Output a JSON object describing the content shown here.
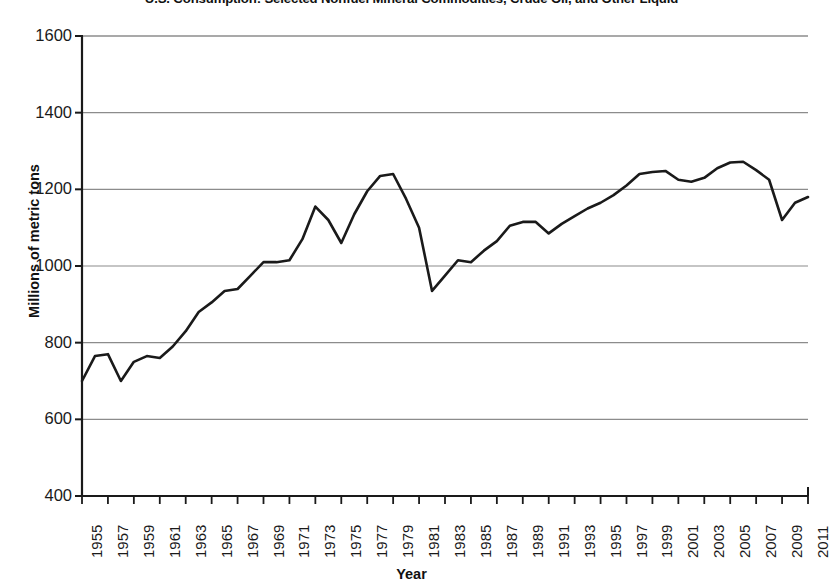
{
  "chart_data": {
    "type": "line",
    "title": "U.S. Consumption: Selected Nonfuel Mineral Commodities,  Crude Oil, and Other Liquid",
    "xlabel": "Year",
    "ylabel": "Millions of metric tons",
    "xlim": [
      1955,
      2011
    ],
    "ylim": [
      400,
      1600
    ],
    "yticks": [
      400,
      600,
      800,
      1000,
      1200,
      1400,
      1600
    ],
    "ytick_labels": [
      "400",
      "600",
      "800",
      "1000",
      "1200",
      "1400",
      "1600"
    ],
    "xticks": [
      1955,
      1957,
      1959,
      1961,
      1963,
      1965,
      1967,
      1969,
      1971,
      1973,
      1975,
      1977,
      1979,
      1981,
      1983,
      1985,
      1987,
      1989,
      1991,
      1993,
      1995,
      1997,
      1999,
      2001,
      2003,
      2005,
      2007,
      2009,
      2011
    ],
    "xtick_labels": [
      "1955",
      "1957",
      "1959",
      "1961",
      "1963",
      "1965",
      "1967",
      "1969",
      "1971",
      "1973",
      "1975",
      "1977",
      "1979",
      "1981",
      "1983",
      "1985",
      "1987",
      "1989",
      "1991",
      "1993",
      "1995",
      "1997",
      "1999",
      "2001",
      "2003",
      "2005",
      "2007",
      "2009",
      "2011"
    ],
    "grid": "horizontal",
    "legend": "none",
    "line_color": "#1a1a1a",
    "grid_color": "#8c8c8c",
    "axis_color": "#1a1a1a",
    "x": [
      1955,
      1956,
      1957,
      1958,
      1959,
      1960,
      1961,
      1962,
      1963,
      1964,
      1965,
      1966,
      1967,
      1968,
      1969,
      1970,
      1971,
      1972,
      1973,
      1974,
      1975,
      1976,
      1977,
      1978,
      1979,
      1980,
      1981,
      1982,
      1983,
      1984,
      1985,
      1986,
      1987,
      1988,
      1989,
      1990,
      1991,
      1992,
      1993,
      1994,
      1995,
      1996,
      1997,
      1998,
      1999,
      2000,
      2001,
      2002,
      2003,
      2004,
      2005,
      2006,
      2007,
      2008,
      2009,
      2010,
      2011
    ],
    "values": [
      700,
      765,
      770,
      700,
      750,
      765,
      760,
      790,
      830,
      880,
      905,
      935,
      940,
      975,
      1010,
      1010,
      1015,
      1070,
      1155,
      1120,
      1060,
      1135,
      1195,
      1235,
      1240,
      1175,
      1100,
      935,
      975,
      1015,
      1010,
      1040,
      1065,
      1105,
      1115,
      1115,
      1085,
      1110,
      1130,
      1150,
      1165,
      1185,
      1210,
      1240,
      1245,
      1248,
      1225,
      1220,
      1230,
      1255,
      1270,
      1272,
      1250,
      1225,
      1120,
      1165,
      1180
    ]
  }
}
